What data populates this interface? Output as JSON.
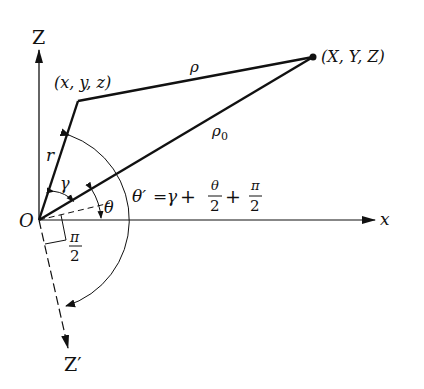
{
  "diagram": {
    "type": "geometry",
    "axes": {
      "z_label": "Z",
      "x_label": "x",
      "z_prime_label": "Z′",
      "origin_label": "O"
    },
    "points": {
      "source": "(x, y, z)",
      "field": "(X, Y, Z)"
    },
    "segments": {
      "r": "r",
      "rho": "ρ",
      "rho0": "ρ",
      "rho0_sub": "0"
    },
    "angles": {
      "gamma": "γ",
      "theta": "θ",
      "right_angle_num": "π",
      "right_angle_den": "2"
    },
    "equation": {
      "lhs": "θ′",
      "eq": "=",
      "gamma": "γ",
      "plus1": "+",
      "theta_num": "θ",
      "theta_den": "2",
      "plus2": "+",
      "pi_num": "π",
      "pi_den": "2"
    },
    "colors": {
      "ink": "#111111",
      "background": "#ffffff"
    }
  }
}
